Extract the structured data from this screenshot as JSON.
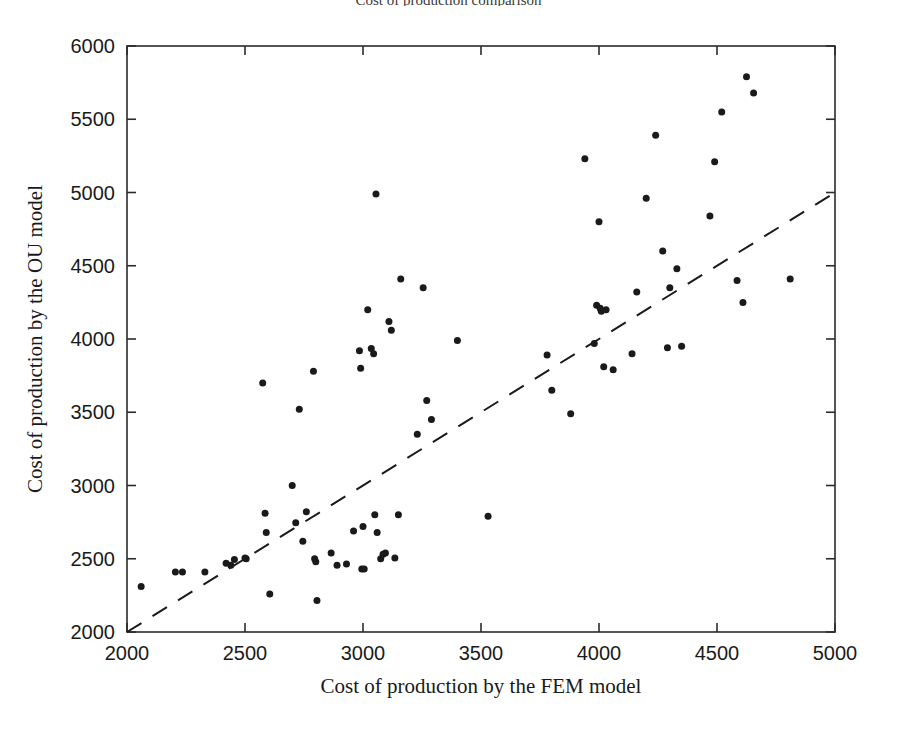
{
  "chart_data": {
    "type": "scatter",
    "title": "Cost of production comparison",
    "xlabel": "Cost of production by the FEM model",
    "ylabel": "Cost of production by the OU model",
    "xlim": [
      2000,
      5000
    ],
    "ylim": [
      2000,
      6000
    ],
    "xticks": [
      2000,
      2500,
      3000,
      3500,
      4000,
      4500,
      5000
    ],
    "yticks": [
      2000,
      2500,
      3000,
      3500,
      4000,
      4500,
      5000,
      5500,
      6000
    ],
    "xtick_labels": [
      "2000",
      "2500",
      "3000",
      "3500",
      "4000",
      "4500",
      "5000"
    ],
    "ytick_labels": [
      "2000",
      "2500",
      "3000",
      "3500",
      "4000",
      "4500",
      "5000",
      "5500",
      "6000"
    ],
    "grid": false,
    "legend": "none",
    "marker": {
      "shape": "circle",
      "color": "#1a1a1a",
      "size_px": 7
    },
    "reference_line": {
      "name": "y = x identity line",
      "style": "dashed",
      "color": "#1a1a1a",
      "from": [
        2000,
        2000
      ],
      "to": [
        5000,
        5000
      ]
    },
    "points": [
      [
        2060,
        2310
      ],
      [
        2205,
        2410
      ],
      [
        2235,
        2410
      ],
      [
        2330,
        2410
      ],
      [
        2420,
        2470
      ],
      [
        2440,
        2455
      ],
      [
        2455,
        2495
      ],
      [
        2500,
        2505
      ],
      [
        2505,
        2500
      ],
      [
        2575,
        3700
      ],
      [
        2585,
        2810
      ],
      [
        2590,
        2680
      ],
      [
        2605,
        2260
      ],
      [
        2700,
        3000
      ],
      [
        2715,
        2745
      ],
      [
        2730,
        3520
      ],
      [
        2745,
        2620
      ],
      [
        2760,
        2820
      ],
      [
        2790,
        3780
      ],
      [
        2795,
        2500
      ],
      [
        2800,
        2480
      ],
      [
        2805,
        2215
      ],
      [
        2865,
        2540
      ],
      [
        2890,
        2455
      ],
      [
        2930,
        2465
      ],
      [
        2960,
        2690
      ],
      [
        2985,
        3920
      ],
      [
        2990,
        3800
      ],
      [
        2995,
        2430
      ],
      [
        3000,
        2720
      ],
      [
        3005,
        2430
      ],
      [
        3020,
        4200
      ],
      [
        3035,
        3935
      ],
      [
        3045,
        3900
      ],
      [
        3050,
        2800
      ],
      [
        3055,
        4990
      ],
      [
        3060,
        2680
      ],
      [
        3075,
        2500
      ],
      [
        3085,
        2530
      ],
      [
        3095,
        2540
      ],
      [
        3110,
        4120
      ],
      [
        3120,
        4060
      ],
      [
        3135,
        2505
      ],
      [
        3150,
        2800
      ],
      [
        3160,
        4410
      ],
      [
        3230,
        3350
      ],
      [
        3255,
        4350
      ],
      [
        3270,
        3580
      ],
      [
        3290,
        3450
      ],
      [
        3400,
        3990
      ],
      [
        3530,
        2790
      ],
      [
        3780,
        3890
      ],
      [
        3800,
        3650
      ],
      [
        3880,
        3490
      ],
      [
        3940,
        5230
      ],
      [
        3980,
        3970
      ],
      [
        3990,
        4230
      ],
      [
        4000,
        4800
      ],
      [
        4005,
        4210
      ],
      [
        4010,
        4190
      ],
      [
        4020,
        3810
      ],
      [
        4030,
        4200
      ],
      [
        4060,
        3790
      ],
      [
        4140,
        3900
      ],
      [
        4160,
        4320
      ],
      [
        4200,
        4960
      ],
      [
        4240,
        5390
      ],
      [
        4270,
        4600
      ],
      [
        4290,
        3940
      ],
      [
        4300,
        4350
      ],
      [
        4330,
        4480
      ],
      [
        4350,
        3950
      ],
      [
        4470,
        4840
      ],
      [
        4490,
        5210
      ],
      [
        4520,
        5550
      ],
      [
        4585,
        4400
      ],
      [
        4610,
        4250
      ],
      [
        4625,
        5790
      ],
      [
        4655,
        5680
      ],
      [
        4810,
        4410
      ]
    ]
  }
}
